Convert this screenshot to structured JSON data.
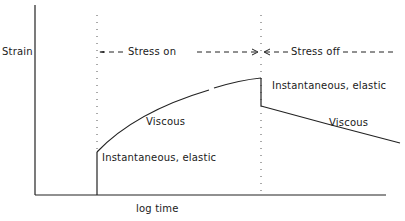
{
  "diagram": {
    "y_axis_label": "Strain",
    "x_axis_label": "log time",
    "phases": {
      "on": "Stress on",
      "off": "Stress off"
    },
    "annotations": {
      "elastic_on": "Instantaneous, elastic",
      "viscous_on": "Viscous",
      "elastic_off": "Instantaneous, elastic",
      "viscous_off": "Viscous"
    },
    "colors": {
      "line": "#222222",
      "background": "#ffffff"
    }
  }
}
